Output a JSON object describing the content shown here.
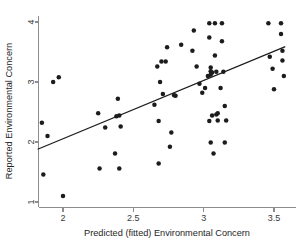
{
  "chart_data": {
    "type": "scatter",
    "title": "",
    "xlabel": "Predicted (fitted) Environmental Concern",
    "ylabel": "Reported Environmental Concern",
    "xlim": [
      1.82,
      3.62
    ],
    "ylim": [
      0.92,
      4.08
    ],
    "xticks": [
      2,
      2.5,
      3,
      3.5
    ],
    "xticklabels": [
      "2",
      "2.5",
      "3",
      "3.5"
    ],
    "yticks": [
      1,
      2,
      3,
      4
    ],
    "yticklabels": [
      "1",
      "2",
      "3",
      "4"
    ],
    "grid": false,
    "legend": null,
    "marker": "filled-circle",
    "marker_color": "#1c1c1c",
    "points": [
      [
        1.85,
        2.32
      ],
      [
        1.86,
        1.46
      ],
      [
        1.89,
        2.1
      ],
      [
        1.93,
        3.0
      ],
      [
        1.97,
        3.08
      ],
      [
        2.0,
        1.1
      ],
      [
        2.25,
        2.48
      ],
      [
        2.26,
        1.56
      ],
      [
        2.3,
        2.24
      ],
      [
        2.37,
        1.81
      ],
      [
        2.38,
        2.43
      ],
      [
        2.39,
        2.72
      ],
      [
        2.4,
        2.44
      ],
      [
        2.4,
        1.56
      ],
      [
        2.41,
        2.26
      ],
      [
        2.65,
        2.62
      ],
      [
        2.67,
        3.26
      ],
      [
        2.68,
        2.35
      ],
      [
        2.68,
        1.64
      ],
      [
        2.69,
        3.0
      ],
      [
        2.7,
        3.34
      ],
      [
        2.71,
        2.8
      ],
      [
        2.73,
        3.34
      ],
      [
        2.74,
        3.58
      ],
      [
        2.76,
        1.92
      ],
      [
        2.77,
        2.16
      ],
      [
        2.79,
        2.78
      ],
      [
        2.8,
        2.77
      ],
      [
        2.84,
        3.62
      ],
      [
        2.92,
        3.52
      ],
      [
        2.93,
        3.86
      ],
      [
        2.95,
        3.26
      ],
      [
        2.97,
        2.97
      ],
      [
        2.99,
        2.82
      ],
      [
        3.01,
        2.9
      ],
      [
        3.03,
        3.1
      ],
      [
        3.04,
        3.98
      ],
      [
        3.04,
        3.74
      ],
      [
        3.04,
        2.35
      ],
      [
        3.05,
        3.24
      ],
      [
        3.05,
        3.18
      ],
      [
        3.05,
        3.12
      ],
      [
        3.05,
        1.99
      ],
      [
        3.06,
        3.16
      ],
      [
        3.06,
        2.44
      ],
      [
        3.07,
        1.81
      ],
      [
        3.08,
        3.98
      ],
      [
        3.08,
        3.44
      ],
      [
        3.09,
        3.17
      ],
      [
        3.09,
        2.46
      ],
      [
        3.1,
        2.48
      ],
      [
        3.1,
        2.36
      ],
      [
        3.12,
        2.9
      ],
      [
        3.13,
        3.98
      ],
      [
        3.13,
        3.68
      ],
      [
        3.14,
        3.17
      ],
      [
        3.15,
        2.6
      ],
      [
        3.15,
        1.99
      ],
      [
        3.16,
        2.36
      ],
      [
        3.46,
        3.98
      ],
      [
        3.47,
        3.42
      ],
      [
        3.49,
        3.22
      ],
      [
        3.5,
        2.88
      ],
      [
        3.55,
        3.98
      ],
      [
        3.55,
        3.8
      ],
      [
        3.56,
        3.52
      ],
      [
        3.56,
        3.36
      ],
      [
        3.57,
        3.1
      ]
    ],
    "fit_line": {
      "label": "linear fit",
      "x": [
        1.82,
        3.58
      ],
      "y": [
        1.88,
        3.59
      ]
    }
  }
}
